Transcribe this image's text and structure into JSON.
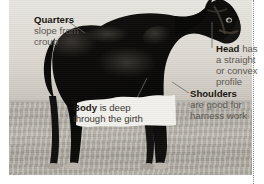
{
  "figure": {
    "photo_alt": "black draught-type horse side view on bare ground"
  },
  "callouts": [
    {
      "id": "quarters",
      "headword": "Quarters",
      "body_line1": "slope from",
      "body_line2": "croup",
      "body": "slope from croup",
      "position": "top-left"
    },
    {
      "id": "head",
      "headword": "Head",
      "body_line1": "has",
      "body_line2": "a straight",
      "body_line3": "or convex",
      "body_line4": "profile",
      "body": "has a straight or convex profile",
      "position": "right"
    },
    {
      "id": "shoulders",
      "headword": "Shoulders",
      "body_line1": "are good for",
      "body_line2": "harness work",
      "body": "are good for harness work",
      "position": "right-lower"
    },
    {
      "id": "body",
      "headword": "Body",
      "body_line1": "is deep",
      "body_line2": "through the girth",
      "body": "is deep through the girth",
      "position": "center-lower"
    }
  ],
  "colors": {
    "headword": "#19160f",
    "body_text": "#5d5a53",
    "horse": "#0c0b09",
    "ground": "#b4b0a7",
    "sky": "#e3e0da",
    "rule": "#8d8a84",
    "page": "#ffffff"
  }
}
